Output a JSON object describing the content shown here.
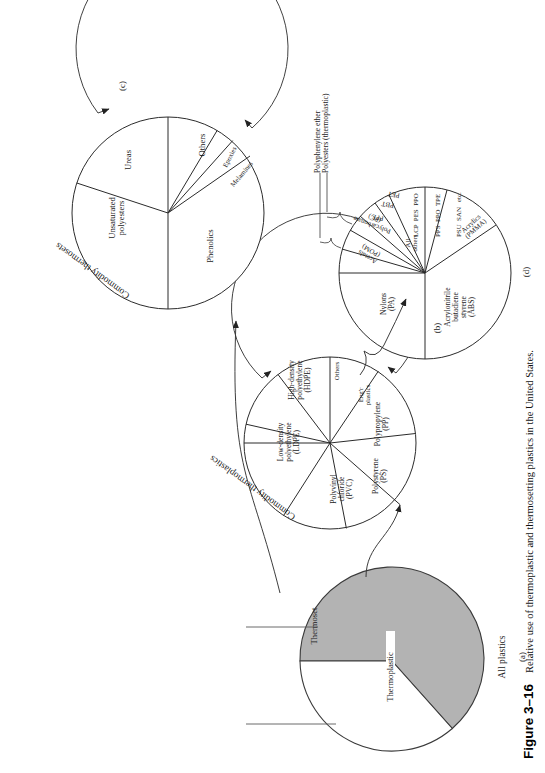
{
  "figure": {
    "number": "Figure 3–16",
    "caption": "Relative use of thermoplastic and thermosetting plastics in the United States."
  },
  "panels": [
    {
      "id": "(a)",
      "title": "All plastics",
      "type": "pie",
      "slices": [
        {
          "label": "Thermoplastic",
          "value": 85,
          "fill": "#b3b3b3"
        },
        {
          "label": "Thermoset",
          "value": 15,
          "fill": "#ffffff"
        }
      ]
    },
    {
      "id": "(b)",
      "title": "Commodity thermoplastics",
      "type": "pie",
      "slices": [
        {
          "label": "Low-density\npolyethylene\n(LDPE)",
          "value": 22
        },
        {
          "label": "High-density\npolyethylene\n(HDPE)",
          "value": 19
        },
        {
          "label": "Others",
          "value": 5
        },
        {
          "label": "Eng'r\nplastics",
          "value": 11
        },
        {
          "label": "Polypropylene\n(PP)",
          "value": 15
        },
        {
          "label": "Polystyrene\n(PS)",
          "value": 11
        },
        {
          "label": "Polyvinyl\nchloride\n(PVC)",
          "value": 17
        }
      ]
    },
    {
      "id": "(c)",
      "title": "Commodity thermosets",
      "type": "pie",
      "slices": [
        {
          "label": "Unsaturated\npolyesters",
          "value": 26
        },
        {
          "label": "Ureas",
          "value": 27
        },
        {
          "label": "Others",
          "value": 9
        },
        {
          "label": "Epoxies",
          "value": 6
        },
        {
          "label": "Melamines",
          "value": 6
        },
        {
          "label": "Phenolics",
          "value": 26
        }
      ]
    },
    {
      "id": "(d)",
      "title": "Engineering plastics",
      "type": "pie",
      "slices": [
        {
          "label": "Nylons\n(PA)",
          "value": 14
        },
        {
          "label": "Acetals\n(POM)",
          "value": 6
        },
        {
          "label": "Polycarbonate\n(PC)",
          "value": 9
        },
        {
          "label": "PPE",
          "value": 5
        },
        {
          "label": "PBT",
          "value": 4
        },
        {
          "label": "PET",
          "value": 4
        },
        {
          "label": "All\nothers",
          "value": 15
        },
        {
          "label": "Acrylics\n(PMMA)",
          "value": 8
        },
        {
          "label": "Acrylonitrile\nbutadiene\nstyrene\n(ABS)",
          "value": 35
        }
      ],
      "others_list": [
        "LCP  PES  PPO",
        "PPS  PPO  TPE",
        "PSU  SAN   etc."
      ],
      "callouts": [
        {
          "label": "Polyphenylene ether",
          "targets": "PPE"
        },
        {
          "label": "Polyesters (thermoplastic)",
          "targets": "PBT PET"
        }
      ]
    }
  ]
}
